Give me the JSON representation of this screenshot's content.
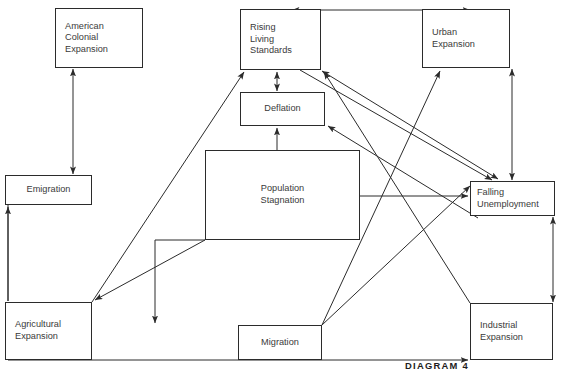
{
  "diagram": {
    "caption": "DIAGRAM 4",
    "stroke_color": "#2b2b2b",
    "text_color": "#3a3a3a",
    "background": "#ffffff",
    "nodes": [
      {
        "id": "american-colonial-expansion",
        "label": "American\nColonial\nExpansion",
        "x": 55,
        "y": 8,
        "w": 88,
        "h": 60,
        "align": "align-left"
      },
      {
        "id": "rising-living-standards",
        "label": "Rising\nLiving\nStandards",
        "x": 240,
        "y": 9,
        "w": 81,
        "h": 61,
        "align": "align-left"
      },
      {
        "id": "urban-expansion",
        "label": "Urban\nExpansion",
        "x": 422,
        "y": 9,
        "w": 88,
        "h": 59,
        "align": "align-left"
      },
      {
        "id": "deflation",
        "label": "Deflation",
        "x": 240,
        "y": 92,
        "w": 85,
        "h": 34,
        "align": "align-center"
      },
      {
        "id": "population-stagnation",
        "label": "Population\nStagnation",
        "x": 205,
        "y": 150,
        "w": 155,
        "h": 90,
        "align": "align-center"
      },
      {
        "id": "emigration",
        "label": "Emigration",
        "x": 5,
        "y": 175,
        "w": 87,
        "h": 30,
        "align": "align-center"
      },
      {
        "id": "falling-unemployment",
        "label": "Falling\nUnemployment",
        "x": 470,
        "y": 181,
        "w": 85,
        "h": 35,
        "align": "align-left"
      },
      {
        "id": "agricultural-expansion",
        "label": "Agricultural\nExpansion",
        "x": 5,
        "y": 302,
        "w": 87,
        "h": 58,
        "align": "align-left"
      },
      {
        "id": "migration",
        "label": "Migration",
        "x": 238,
        "y": 325,
        "w": 84,
        "h": 35,
        "align": "align-center"
      },
      {
        "id": "industrial-expansion",
        "label": "Industrial\nExpansion",
        "x": 470,
        "y": 303,
        "w": 83,
        "h": 57,
        "align": "align-left"
      }
    ],
    "edges": [
      {
        "id": "emigration-american-colonial-expansion",
        "from": "emigration",
        "to": "american-colonial-expansion",
        "arrows": "both",
        "kind": "vertical"
      },
      {
        "id": "rising-living-standards-urban-expansion",
        "from": "rising-living-standards",
        "to": "urban-expansion",
        "arrows": "both",
        "kind": "horizontal-top"
      },
      {
        "id": "rising-living-standards-deflation",
        "from": "rising-living-standards",
        "to": "deflation",
        "arrows": "both",
        "kind": "vertical"
      },
      {
        "id": "population-stagnation-deflation",
        "from": "population-stagnation",
        "to": "deflation",
        "arrows": "to",
        "kind": "vertical"
      },
      {
        "id": "population-stagnation-falling-unemployment",
        "from": "population-stagnation",
        "to": "falling-unemployment",
        "arrows": "to",
        "kind": "horizontal"
      },
      {
        "id": "population-stagnation-migration",
        "from": "population-stagnation",
        "to": "migration",
        "arrows": "to",
        "kind": "vertical"
      },
      {
        "id": "population-stagnation-agricultural-expansion",
        "from": "population-stagnation",
        "to": "agricultural-expansion",
        "arrows": "to",
        "kind": "diagonal"
      },
      {
        "id": "emigration-agricultural-expansion",
        "from": "emigration",
        "to": "agricultural-expansion",
        "arrows": "to",
        "kind": "vertical"
      },
      {
        "id": "agricultural-expansion-emigration",
        "from": "agricultural-expansion",
        "to": "emigration",
        "arrows": "to",
        "kind": "vertical-left"
      },
      {
        "id": "agricultural-expansion-rising-living-standards",
        "from": "agricultural-expansion",
        "to": "rising-living-standards",
        "arrows": "to",
        "kind": "diagonal"
      },
      {
        "id": "agricultural-expansion-industrial-expansion",
        "from": "agricultural-expansion",
        "to": "industrial-expansion",
        "arrows": "to",
        "kind": "horizontal-bottom"
      },
      {
        "id": "migration-urban-expansion",
        "from": "migration",
        "to": "urban-expansion",
        "arrows": "to",
        "kind": "diagonal"
      },
      {
        "id": "industrial-expansion-rising-living-standards",
        "from": "industrial-expansion",
        "to": "rising-living-standards",
        "arrows": "to",
        "kind": "diagonal"
      },
      {
        "id": "industrial-expansion-deflation",
        "from": "industrial-expansion",
        "to": "deflation",
        "arrows": "to",
        "kind": "diagonal"
      },
      {
        "id": "rising-living-standards-falling-unemployment",
        "from": "rising-living-standards",
        "to": "falling-unemployment",
        "arrows": "both",
        "kind": "diagonal"
      },
      {
        "id": "urban-expansion-falling-unemployment",
        "from": "urban-expansion",
        "to": "falling-unemployment",
        "arrows": "both",
        "kind": "vertical"
      },
      {
        "id": "falling-unemployment-industrial-expansion",
        "from": "falling-unemployment",
        "to": "industrial-expansion",
        "arrows": "both",
        "kind": "vertical"
      },
      {
        "id": "migration-falling-unemployment",
        "from": "migration",
        "to": "falling-unemployment",
        "arrows": "to",
        "kind": "diagonal"
      }
    ]
  }
}
